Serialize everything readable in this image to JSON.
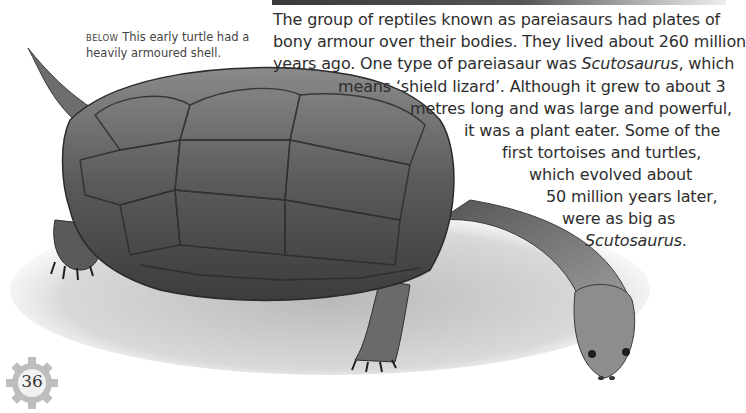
{
  "caption": {
    "lead": "BELOW",
    "text": "This early turtle had a heavily armoured shell."
  },
  "main_text": {
    "lines": [
      {
        "text": "The group of reptiles known as pareiasaurs had plates of"
      },
      {
        "text": "bony armour over their bodies. They lived about 260 million"
      },
      {
        "pre": "years ago. One type of pareiasaur was ",
        "italic": "Scutosaurus",
        "post": ", which"
      },
      {
        "text": "means ‘shield lizard’. Although it grew to about 3"
      },
      {
        "text": "metres long and was large and powerful,"
      },
      {
        "text": "it was a plant eater. Some of the"
      },
      {
        "text": "first tortoises and turtles,"
      },
      {
        "text": "which evolved about"
      },
      {
        "text": "50 million years later,"
      },
      {
        "text": "were as big as"
      },
      {
        "italic": "Scutosaurus",
        "post": "."
      }
    ]
  },
  "illustration": {
    "subject": "Scutosaurus / early turtle illustration",
    "colors": {
      "shell_dark": "#3d3d3d",
      "shell_mid": "#7a7a7a",
      "ground": "#cfcfcf"
    }
  },
  "page": {
    "number": "36",
    "badge_color": "#bdbdbd"
  }
}
